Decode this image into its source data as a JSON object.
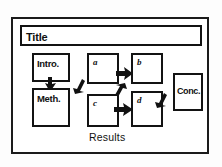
{
  "diagram": {
    "title": "Title",
    "caption": "Results",
    "sections": [
      {
        "id": "title",
        "label": "Title"
      },
      {
        "id": "intro",
        "label": "Intro."
      },
      {
        "id": "method",
        "label": "Meth."
      },
      {
        "id": "conclusion",
        "label": "Conc."
      }
    ],
    "result_panels": [
      {
        "id": "a",
        "label": "a"
      },
      {
        "id": "b",
        "label": "b"
      },
      {
        "id": "c",
        "label": "c"
      },
      {
        "id": "d",
        "label": "d"
      }
    ],
    "arrows": [
      {
        "id": "intro-to-method",
        "direction": "down"
      },
      {
        "id": "method-to-results",
        "direction": "up-right"
      },
      {
        "id": "a-to-b",
        "direction": "right"
      },
      {
        "id": "b-to-c",
        "direction": "down-left"
      },
      {
        "id": "c-to-d",
        "direction": "right"
      },
      {
        "id": "results-to-conclusion",
        "direction": "up-right"
      }
    ],
    "colors": {
      "ink": "#111111",
      "paper": "#ffffff",
      "frame": "#1b1b1b",
      "background": "#fdfdfd"
    }
  }
}
